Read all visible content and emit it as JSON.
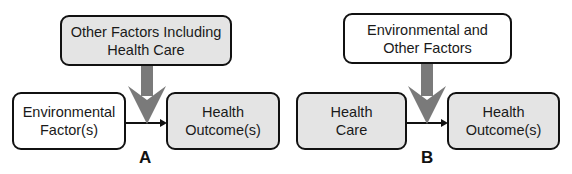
{
  "panels": [
    {
      "id": "A",
      "label": "A",
      "top_box": {
        "text": "Other Factors Including\nHealth Care",
        "fill": "#e4e4e4"
      },
      "left_box": {
        "text": "Environmental\nFactor(s)",
        "fill": "#ffffff"
      },
      "right_box": {
        "text": "Health\nOutcome(s)",
        "fill": "#e4e4e4"
      }
    },
    {
      "id": "B",
      "label": "B",
      "top_box": {
        "text": "Environmental and\nOther Factors",
        "fill": "#ffffff"
      },
      "left_box": {
        "text": "Health\nCare",
        "fill": "#e4e4e4"
      },
      "right_box": {
        "text": "Health\nOutcome(s)",
        "fill": "#e4e4e4"
      }
    }
  ],
  "colors": {
    "box_border": "#111111",
    "gray_fill": "#e4e4e4",
    "arrow_gray": "#7a7a7a",
    "line": "#111111"
  }
}
